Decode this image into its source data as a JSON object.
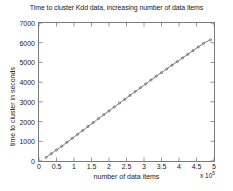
{
  "chart_data": {
    "type": "line",
    "title": "Time to cluster Kdd data, increasing number of data items",
    "xlabel": "number of data items",
    "ylabel": "time to cluster in seconds",
    "x_exponent_prefix": "x 10",
    "x_exponent_power": "5",
    "xlim": [
      0,
      5
    ],
    "ylim": [
      0,
      7000
    ],
    "xticks": [
      0,
      0.5,
      1,
      1.5,
      2,
      2.5,
      3,
      3.5,
      4,
      4.5,
      5
    ],
    "xtick_labels": [
      "0",
      "0.5",
      "1",
      "1.5",
      "2",
      "2.5",
      "3",
      "3.5",
      "4",
      "4.5",
      "5"
    ],
    "yticks": [
      0,
      1000,
      2000,
      3000,
      4000,
      5000,
      6000,
      7000
    ],
    "ytick_labels": [
      "0",
      "1000",
      "2000",
      "3000",
      "4000",
      "5000",
      "6000",
      "7000"
    ],
    "grid": false,
    "legend": false,
    "marker": "dot",
    "line_color": "#4b4b4b",
    "axis_color": "#7a7a7a",
    "series": [
      {
        "name": "time to cluster",
        "x": [
          0.2,
          0.35,
          0.5,
          0.65,
          0.8,
          0.95,
          1.1,
          1.25,
          1.4,
          1.55,
          1.7,
          1.85,
          2.0,
          2.15,
          2.3,
          2.45,
          2.6,
          2.75,
          2.9,
          3.05,
          3.2,
          3.35,
          3.5,
          3.65,
          3.8,
          3.95,
          4.1,
          4.25,
          4.4,
          4.55,
          4.7,
          4.9
        ],
        "y": [
          180,
          370,
          560,
          750,
          950,
          1150,
          1350,
          1550,
          1750,
          1950,
          2150,
          2350,
          2540,
          2740,
          2940,
          3130,
          3330,
          3520,
          3720,
          3910,
          4110,
          4300,
          4480,
          4670,
          4860,
          5040,
          5230,
          5410,
          5600,
          5780,
          5970,
          6150
        ]
      }
    ]
  }
}
